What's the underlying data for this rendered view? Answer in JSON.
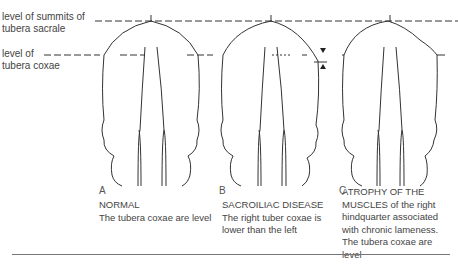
{
  "labels": {
    "sacrale_line1": "level of summits of",
    "sacrale_line2": "tubera sacrale",
    "coxae_line1": "level of",
    "coxae_line2": "tubera coxae"
  },
  "panels": [
    {
      "letter": "A",
      "title": "NORMAL",
      "text": "The tubera coxae are level"
    },
    {
      "letter": "B",
      "title": "SACROILIAC DISEASE",
      "text": "The right tuber coxae is lower than the left"
    },
    {
      "letter": "C",
      "title": "ATROPHY OF THE",
      "text": "MUSCLES of the right hindquarter associated with chronic lameness. The tubera coxae are level"
    }
  ],
  "colors": {
    "line": "#222222",
    "text": "#444444"
  }
}
